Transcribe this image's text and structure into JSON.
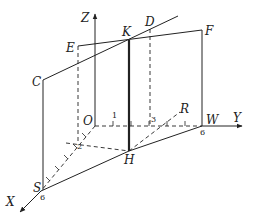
{
  "diagram": {
    "type": "3d-geometry-axes",
    "axes": {
      "x_label": "X",
      "y_label": "Y",
      "z_label": "Z"
    },
    "points": {
      "O": "O",
      "C": "C",
      "D": "D",
      "E": "E",
      "F": "F",
      "K": "K",
      "H": "H",
      "R": "R",
      "S": "S",
      "W": "W"
    },
    "tick_labels": {
      "y1": "1",
      "y3": "3",
      "y6": "6",
      "x2": "2",
      "x6": "6"
    },
    "colors": {
      "line": "#222222",
      "background": "#ffffff"
    }
  }
}
